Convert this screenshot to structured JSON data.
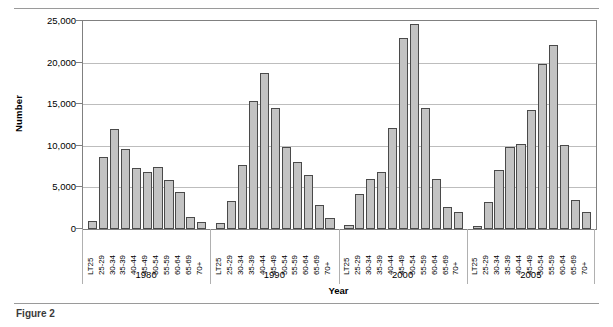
{
  "chart_data": {
    "type": "bar",
    "title": "",
    "xlabel": "Year",
    "ylabel": "Number",
    "ylim": [
      0,
      25000
    ],
    "ytick_labels": [
      "0",
      "5,000",
      "10,000",
      "15,000",
      "20,000",
      "25,000"
    ],
    "ytick_values": [
      0,
      5000,
      10000,
      15000,
      20000,
      25000
    ],
    "grid": true,
    "legend": "none",
    "categories": [
      "LT25",
      "25-29",
      "30-34",
      "35-39",
      "40-44",
      "45-49",
      "50-54",
      "55-59",
      "60-64",
      "65-69",
      "70+"
    ],
    "groups": [
      {
        "label": "1980",
        "values": [
          1000,
          8600,
          12000,
          9600,
          7300,
          6900,
          7400,
          5900,
          4500,
          1400,
          900
        ]
      },
      {
        "label": "1990",
        "values": [
          700,
          3400,
          7700,
          15400,
          18800,
          14600,
          9900,
          8000,
          6500,
          2900,
          1300
        ]
      },
      {
        "label": "2000",
        "values": [
          500,
          4200,
          6000,
          6900,
          12100,
          23000,
          24700,
          14600,
          6000,
          2600,
          2000
        ]
      },
      {
        "label": "2005",
        "values": [
          400,
          3200,
          7100,
          9900,
          10200,
          14300,
          19800,
          22100,
          10100,
          3500,
          2000
        ]
      }
    ],
    "bar_fill_color": "#c3c3c3",
    "bar_edge_color": "#4a4a4a",
    "grid_color": "#bdbdbd",
    "axis_color": "#808080"
  },
  "caption": {
    "text": "Figure 2"
  }
}
